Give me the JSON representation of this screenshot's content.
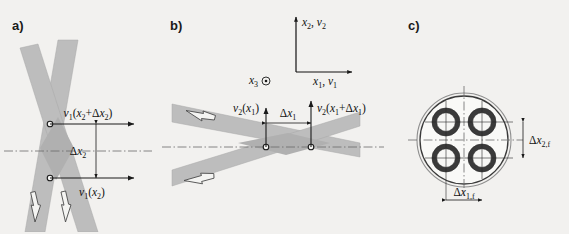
{
  "figure": {
    "background_color": "#f2f1ef",
    "beam_color": "#bdbdbd",
    "line_color": "#1a1a1a",
    "width": 569,
    "height": 234
  },
  "panels": [
    {
      "id": "a",
      "label": "a)",
      "description": "Steeply crossing beams with horizontal velocity vectors separated vertically",
      "annotations": {
        "velocity_upper": {
          "text": "v₁(x₂+Δx₂)",
          "base": "v",
          "base_sub": "1",
          "arg": "(x₂+Δx₂)"
        },
        "velocity_lower": {
          "text": "v₁(x₂)",
          "base": "v",
          "base_sub": "1",
          "arg": "(x₂)"
        },
        "separation": {
          "text": "Δx₂",
          "base": "Δx",
          "base_sub": "2"
        }
      }
    },
    {
      "id": "b",
      "label": "b)",
      "description": "Shallowly crossing beams with vertical velocity vectors separated horizontally, plus coordinate triad",
      "axes": {
        "vertical_label": "x₂, v₂",
        "horizontal_label": "x₁, v₁",
        "out_of_plane_label": "x₃",
        "out_of_plane_symbol": "circled-dot"
      },
      "annotations": {
        "velocity_left": {
          "text": "v₂(x₁)",
          "base": "v",
          "base_sub": "2",
          "arg": "(x₁)"
        },
        "velocity_right": {
          "text": "v₂(x₁+Δx₁)",
          "base": "v",
          "base_sub": "2",
          "arg": "(x₁+Δx₁)"
        },
        "separation": {
          "text": "Δx₁",
          "base": "Δx",
          "base_sub": "1"
        }
      }
    },
    {
      "id": "c",
      "label": "c)",
      "description": "Cross-section of a circular duct containing four annular fibre cores in a square arrangement",
      "annotations": {
        "dim_vertical": {
          "text": "Δx₂,f",
          "base": "Δx",
          "base_sub": "2,f"
        },
        "dim_horizontal": {
          "text": "Δx₁,f",
          "base": "Δx",
          "base_sub": "1,f"
        }
      },
      "core_count": 4
    }
  ]
}
